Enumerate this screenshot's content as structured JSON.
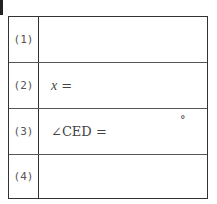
{
  "table": {
    "rows": [
      {
        "label": "(1)",
        "answer": ""
      },
      {
        "label": "(2)",
        "variable": "x",
        "suffix": " ="
      },
      {
        "label": "(3)",
        "answer": "∠CED =",
        "unit": "°"
      },
      {
        "label": "(4)",
        "answer": ""
      }
    ]
  }
}
